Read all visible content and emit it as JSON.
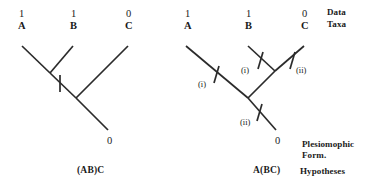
{
  "figure": {
    "background_color": "#ffffff",
    "line_color": "#2b2b2b",
    "width": 372,
    "height": 195
  },
  "row_labels": {
    "data": "Data",
    "taxa": "Taxa",
    "plesiomorphic": "Plesiomophic",
    "form": "Form.",
    "hypotheses": "Hypotheses"
  },
  "trees": [
    {
      "id": "left-tree",
      "hypothesis_label": "(AB)C",
      "topology": "(AB)C",
      "root_state": "0",
      "tips": [
        {
          "taxon": "A",
          "state": "1"
        },
        {
          "taxon": "B",
          "state": "1"
        },
        {
          "taxon": "C",
          "state": "0"
        }
      ],
      "step_marks": [
        {
          "label": "",
          "on_branch": "AB-stem"
        }
      ],
      "step_count": 1
    },
    {
      "id": "right-tree",
      "hypothesis_label": "A(BC)",
      "topology": "A(BC)",
      "root_state": "0",
      "tips": [
        {
          "taxon": "A",
          "state": "1"
        },
        {
          "taxon": "B",
          "state": "1"
        },
        {
          "taxon": "C",
          "state": "0"
        }
      ],
      "step_marks": [
        {
          "label": "(i)",
          "on_branch": "A"
        },
        {
          "label": "(i)",
          "on_branch": "B"
        },
        {
          "label": "(ii)",
          "on_branch": "C"
        },
        {
          "label": "(ii)",
          "on_branch": "root-stem"
        }
      ],
      "step_count": 2
    }
  ]
}
